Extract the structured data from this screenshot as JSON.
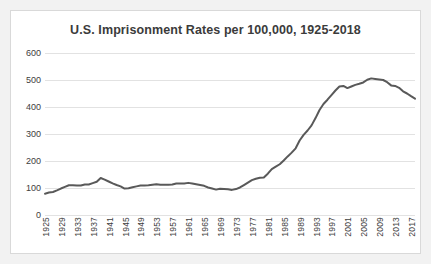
{
  "chart_data": {
    "type": "line",
    "title": "U.S. Imprisonment Rates per 100,000, 1925-2018",
    "xlabel": "",
    "ylabel": "",
    "ylim": [
      0,
      600
    ],
    "ytick_labels": [
      "600",
      "500",
      "400",
      "300",
      "200",
      "100",
      "0"
    ],
    "ytick_values": [
      600,
      500,
      400,
      300,
      200,
      100,
      0
    ],
    "grid": true,
    "legend": "none",
    "line_color": "#595959",
    "xtick_labels": [
      "1925",
      "1929",
      "1933",
      "1937",
      "1941",
      "1945",
      "1949",
      "1953",
      "1957",
      "1961",
      "1965",
      "1969",
      "1973",
      "1977",
      "1981",
      "1985",
      "1989",
      "1993",
      "1997",
      "2001",
      "2005",
      "2009",
      "2013",
      "2017"
    ],
    "xlim": [
      1925,
      2018
    ],
    "x": [
      1925,
      1926,
      1927,
      1928,
      1929,
      1930,
      1931,
      1932,
      1933,
      1934,
      1935,
      1936,
      1937,
      1938,
      1939,
      1940,
      1941,
      1942,
      1943,
      1944,
      1945,
      1946,
      1947,
      1948,
      1949,
      1950,
      1951,
      1952,
      1953,
      1954,
      1955,
      1956,
      1957,
      1958,
      1959,
      1960,
      1961,
      1962,
      1963,
      1964,
      1965,
      1966,
      1967,
      1968,
      1969,
      1970,
      1971,
      1972,
      1973,
      1974,
      1975,
      1976,
      1977,
      1978,
      1979,
      1980,
      1981,
      1982,
      1983,
      1984,
      1985,
      1986,
      1987,
      1988,
      1989,
      1990,
      1991,
      1992,
      1993,
      1994,
      1995,
      1996,
      1997,
      1998,
      1999,
      2000,
      2001,
      2002,
      2003,
      2004,
      2005,
      2006,
      2007,
      2008,
      2009,
      2010,
      2011,
      2012,
      2013,
      2014,
      2015,
      2016,
      2017,
      2018
    ],
    "values": [
      79,
      83,
      85,
      91,
      98,
      104,
      110,
      110,
      109,
      109,
      113,
      113,
      118,
      123,
      137,
      131,
      124,
      117,
      111,
      106,
      98,
      99,
      103,
      106,
      109,
      109,
      110,
      112,
      114,
      112,
      112,
      112,
      113,
      117,
      117,
      117,
      119,
      117,
      114,
      111,
      108,
      102,
      98,
      94,
      97,
      96,
      95,
      93,
      96,
      102,
      111,
      120,
      129,
      134,
      138,
      139,
      153,
      170,
      179,
      188,
      202,
      217,
      231,
      247,
      276,
      297,
      313,
      332,
      359,
      389,
      411,
      427,
      444,
      461,
      476,
      478,
      470,
      476,
      482,
      486,
      491,
      501,
      506,
      504,
      502,
      500,
      492,
      480,
      478,
      471,
      458,
      450,
      440,
      431
    ],
    "peak": {
      "year": 2007,
      "value": 506
    },
    "start": {
      "year": 1925,
      "value": 79
    },
    "end": {
      "year": 2018,
      "value": 431
    },
    "min_recent": {
      "year": 1972,
      "value": 93
    }
  }
}
